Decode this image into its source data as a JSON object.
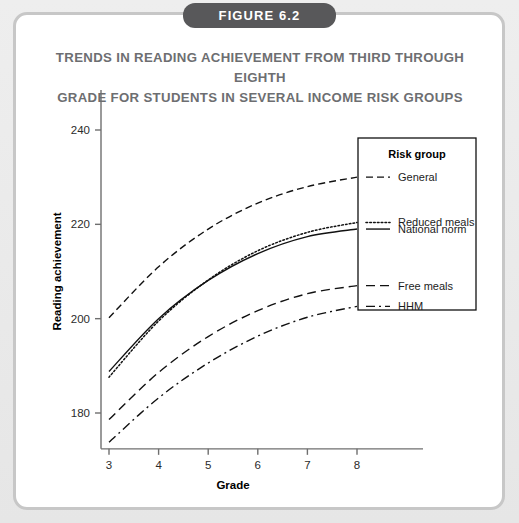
{
  "figure": {
    "badge_label": "FIGURE 6.2",
    "title_line1": "TRENDS IN READING ACHIEVEMENT FROM THIRD THROUGH EIGHTH",
    "title_line2": "GRADE FOR STUDENTS IN SEVERAL INCOME RISK GROUPS",
    "title_color": "#6d6e71",
    "badge_color": "#58585a",
    "frame_color": "#c7c7c7",
    "background_color": "#e9e9e9"
  },
  "chart_data": {
    "type": "line",
    "title": "TRENDS IN READING ACHIEVEMENT FROM THIRD THROUGH EIGHTH GRADE FOR STUDENTS IN SEVERAL INCOME RISK GROUPS",
    "xlabel": "Grade",
    "ylabel": "Reading achievement",
    "x": [
      3,
      4,
      5,
      6,
      7,
      8
    ],
    "xticks": [
      "3",
      "4",
      "5",
      "6",
      "7",
      "8"
    ],
    "xlim": [
      2.75,
      8.3
    ],
    "yticks": [
      "180",
      "200",
      "220",
      "240"
    ],
    "ytickvals": [
      180,
      200,
      220,
      240
    ],
    "ylim": [
      172,
      246
    ],
    "grid": false,
    "legend_position": "right-inside",
    "legend_title": "Risk group",
    "series": [
      {
        "name": "General",
        "dash": "dashed",
        "values": [
          200.2,
          211.0,
          219.0,
          224.5,
          228.0,
          230.0
        ]
      },
      {
        "name": "Reduced meals",
        "dash": "dotted",
        "values": [
          187.6,
          199.5,
          208.2,
          214.4,
          218.3,
          220.4
        ]
      },
      {
        "name": "National norm",
        "dash": "solid",
        "values": [
          188.8,
          200.0,
          208.1,
          213.8,
          217.4,
          219.0
        ]
      },
      {
        "name": "Free meals",
        "dash": "longdash",
        "values": [
          178.6,
          188.6,
          196.2,
          201.7,
          205.3,
          207.0
        ]
      },
      {
        "name": "HHM",
        "dash": "dashdot",
        "values": [
          173.8,
          183.2,
          190.6,
          196.3,
          200.3,
          202.6
        ]
      }
    ]
  }
}
